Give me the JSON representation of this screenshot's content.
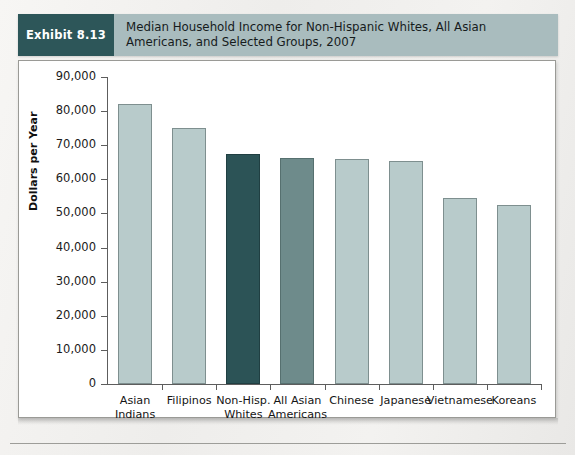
{
  "exhibit": {
    "tag": "Exhibit 8.13",
    "title_line1": "Median Household Income for Non-Hispanic Whites, All Asian",
    "title_line2": "Americans, and Selected Groups, 2007",
    "tag_color": "#2d5659",
    "band_color": "#a9bcbe"
  },
  "chart_data": {
    "type": "bar",
    "title": "Median Household Income for Non-Hispanic Whites, All Asian Americans, and Selected Groups, 2007",
    "xlabel": "",
    "ylabel": "Dollars per Year",
    "ylim": [
      0,
      90000
    ],
    "ytick_values": [
      0,
      10000,
      20000,
      30000,
      40000,
      50000,
      60000,
      70000,
      80000,
      90000
    ],
    "ytick_labels": [
      "0",
      "10,000",
      "20,000",
      "30,000",
      "40,000",
      "50,000",
      "60,000",
      "70,000",
      "80,000",
      "90,000"
    ],
    "grid": false,
    "legend": "none",
    "categories": [
      "Asian\nIndians",
      "Filipinos",
      "Non-Hisp.\nWhites",
      "All Asian\nAmericans",
      "Chinese",
      "Japanese",
      "Vietnamese",
      "Koreans"
    ],
    "values": [
      82000,
      75000,
      67500,
      66200,
      66000,
      65400,
      54500,
      52600
    ],
    "bar_colors": [
      "#b8cbcb",
      "#b8cbcb",
      "#2c5356",
      "#6e8b8b",
      "#b8cbcb",
      "#b8cbcb",
      "#b8cbcb",
      "#b8cbcb"
    ]
  }
}
